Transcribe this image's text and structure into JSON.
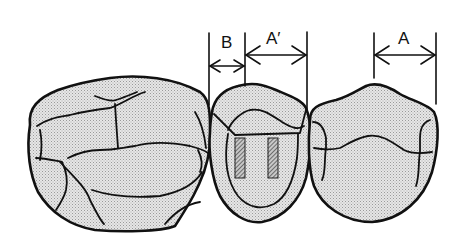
{
  "diagram": {
    "type": "dental-illustration",
    "labels": {
      "b": "B",
      "a_prime": "A′",
      "a": "A"
    },
    "dimensions": [
      {
        "label": "B",
        "from_x": 209,
        "to_x": 245,
        "y": 66
      },
      {
        "label": "A′",
        "from_x": 245,
        "to_x": 307,
        "y": 55
      },
      {
        "label": "A",
        "from_x": 374,
        "to_x": 436,
        "y": 55
      }
    ],
    "colors": {
      "line": "#111111",
      "fill": "#d9d9d9",
      "pin": "#7a7a7a",
      "background": "#ffffff"
    }
  }
}
